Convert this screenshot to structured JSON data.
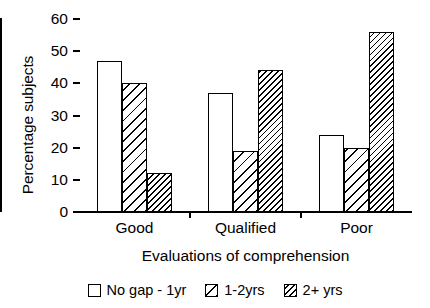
{
  "chart_data": {
    "type": "bar",
    "title": "",
    "xlabel": "Evaluations of comprehension",
    "ylabel": "Percentage subjects",
    "categories": [
      "Good",
      "Qualified",
      "Poor"
    ],
    "series": [
      {
        "name": "No gap - 1yr",
        "pattern": "none",
        "values": [
          47,
          37,
          24
        ]
      },
      {
        "name": "1-2yrs",
        "pattern": "wide",
        "values": [
          40,
          19,
          20
        ]
      },
      {
        "name": "2+ yrs",
        "pattern": "dense",
        "values": [
          12,
          44,
          56
        ]
      }
    ],
    "ylim": [
      0,
      60
    ],
    "yticks": [
      0,
      10,
      20,
      30,
      40,
      50,
      60
    ],
    "ytick_labels": [
      "0",
      "10",
      "20",
      "30",
      "40",
      "50",
      "60"
    ],
    "grid": false,
    "legend_position": "bottom",
    "colors": {
      "line": "#000000",
      "fill": "#ffffff",
      "hatch": "#000000"
    }
  }
}
